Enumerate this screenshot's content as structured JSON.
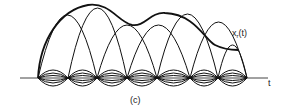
{
  "diagram": {
    "signal_label": "x_r(t)",
    "signal_label_main": "x",
    "signal_label_sub": "r",
    "signal_label_arg": "(t)",
    "axis_label": "t",
    "caption": "(c)",
    "stroke_color": "#111111",
    "axis": {
      "x1": 20,
      "x2": 268,
      "y": 78
    },
    "nodes": [
      38,
      68,
      97,
      127,
      157,
      190,
      218,
      247
    ],
    "large_lobes": [
      {
        "from": 38,
        "to": 97,
        "peak": 15
      },
      {
        "from": 68,
        "to": 127,
        "peak": 8
      },
      {
        "from": 97,
        "to": 157,
        "peak": 25
      },
      {
        "from": 127,
        "to": 190,
        "peak": 25
      },
      {
        "from": 157,
        "to": 218,
        "peak": 14
      },
      {
        "from": 190,
        "to": 247,
        "peak": 22
      },
      {
        "from": 218,
        "to": 247,
        "peak": 45
      }
    ],
    "envelope": "M38,78 C40,40 60,10 88,5 C110,2 118,22 132,25 C145,27 150,12 165,13 C195,14 205,40 215,45 C225,50 232,50 238,50"
  }
}
